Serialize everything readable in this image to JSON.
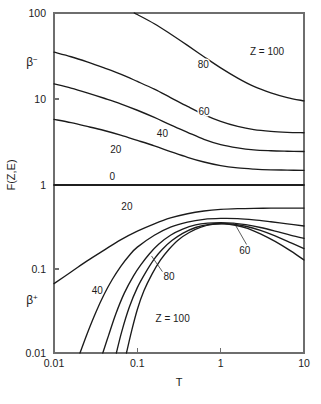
{
  "chart_data": {
    "type": "line",
    "title": "",
    "xlabel": "T",
    "ylabel": "F(Z,E)",
    "xscale": "log",
    "yscale": "log",
    "xlim": [
      0.01,
      10
    ],
    "ylim": [
      0.01,
      100
    ],
    "grid": false,
    "legend": "inline-curve-labels",
    "xticks": [
      "0.01",
      "0.1",
      "1",
      "10"
    ],
    "xtick_values": [
      0.01,
      0.1,
      1,
      10
    ],
    "yticks": [
      "100",
      "10",
      "1",
      "0.1",
      "0.01"
    ],
    "ytick_values": [
      100,
      10,
      1,
      0.1,
      0.01
    ],
    "panels": [
      {
        "name": "beta-minus",
        "label": "β",
        "label_superscript": "−",
        "ylim": [
          1,
          100
        ],
        "series": [
          {
            "name": "Z = 100",
            "label": "Z = 100",
            "label_x": 3.6,
            "label_y": 36.0,
            "x": [
              0.01,
              0.016,
              0.025,
              0.04,
              0.063,
              0.1,
              0.16,
              0.25,
              0.4,
              0.63,
              1.0,
              1.6,
              2.5,
              4.0,
              6.3,
              10.0
            ],
            "y": [
              260.0,
              218.0,
              180.0,
              148.0,
              120.0,
              96.0,
              75.0,
              57.0,
              42.0,
              31.0,
              23.0,
              17.5,
              14.0,
              11.8,
              10.4,
              9.5
            ]
          },
          {
            "name": "80",
            "label": "80",
            "label_x": 0.62,
            "label_y": 25.0,
            "x": [
              0.01,
              0.016,
              0.025,
              0.04,
              0.063,
              0.1,
              0.16,
              0.25,
              0.4,
              0.63,
              1.0,
              1.6,
              2.5,
              4.0,
              6.3,
              10.0
            ],
            "y": [
              35.0,
              31.0,
              27.0,
              23.0,
              19.5,
              16.0,
              13.0,
              10.4,
              8.2,
              6.6,
              5.5,
              4.8,
              4.4,
              4.2,
              4.1,
              4.05
            ]
          },
          {
            "name": "60",
            "label": "60",
            "label_x": 0.63,
            "label_y": 7.2,
            "x": [
              0.01,
              0.016,
              0.025,
              0.04,
              0.063,
              0.1,
              0.16,
              0.25,
              0.4,
              0.63,
              1.0,
              1.6,
              2.5,
              4.0,
              6.3,
              10.0
            ],
            "y": [
              15.0,
              13.4,
              11.8,
              10.2,
              8.8,
              7.4,
              6.1,
              5.0,
              4.1,
              3.4,
              2.95,
              2.7,
              2.56,
              2.5,
              2.47,
              2.45
            ]
          },
          {
            "name": "40",
            "label": "40",
            "label_x": 0.2,
            "label_y": 4.0,
            "x": [
              0.01,
              0.016,
              0.025,
              0.04,
              0.063,
              0.1,
              0.16,
              0.25,
              0.4,
              0.63,
              1.0,
              1.6,
              2.5,
              4.0,
              6.3,
              10.0
            ],
            "y": [
              5.8,
              5.3,
              4.8,
              4.3,
              3.8,
              3.3,
              2.85,
              2.45,
              2.1,
              1.85,
              1.68,
              1.58,
              1.53,
              1.5,
              1.49,
              1.48
            ]
          },
          {
            "name": "20",
            "label": "20",
            "label_x": 0.055,
            "label_y": 2.6,
            "x": [
              0.01,
              0.1,
              1.0,
              10.0
            ],
            "y": [
              1.001,
              1.001,
              1.001,
              1.001
            ]
          },
          {
            "name": "0",
            "label": "0",
            "label_x": 0.05,
            "label_y": 1.25,
            "x": [
              0.01,
              10.0
            ],
            "y": [
              1.0,
              1.0
            ]
          }
        ]
      },
      {
        "name": "beta-plus",
        "label": "β",
        "label_superscript": "+",
        "ylim": [
          0.01,
          1
        ],
        "series": [
          {
            "name": "20",
            "label": "20",
            "label_x": 0.075,
            "label_y": 0.55,
            "x": [
              0.01,
              0.016,
              0.025,
              0.04,
              0.063,
              0.1,
              0.16,
              0.25,
              0.4,
              0.63,
              1.0,
              1.6,
              2.5,
              4.0,
              6.3,
              10.0
            ],
            "y": [
              0.067,
              0.092,
              0.125,
              0.168,
              0.222,
              0.282,
              0.345,
              0.405,
              0.455,
              0.49,
              0.512,
              0.523,
              0.528,
              0.53,
              0.531,
              0.531
            ]
          },
          {
            "name": "40",
            "label": "40",
            "label_x": 0.033,
            "label_y": 0.055,
            "x": [
              0.0205,
              0.025,
              0.032,
              0.04,
              0.05,
              0.063,
              0.08,
              0.1,
              0.16,
              0.25,
              0.4,
              0.63,
              1.0,
              1.6,
              2.5,
              4.0,
              6.3,
              10.0
            ],
            "y": [
              0.01,
              0.017,
              0.031,
              0.05,
              0.075,
              0.107,
              0.145,
              0.182,
              0.252,
              0.315,
              0.362,
              0.39,
              0.4,
              0.398,
              0.385,
              0.365,
              0.345,
              0.325
            ]
          },
          {
            "name": "60",
            "label": "60",
            "label_x": 1.95,
            "label_y": 0.165,
            "leader": {
              "x1": 2.05,
              "y1": 0.195,
              "x2": 1.45,
              "y2": 0.355
            },
            "x": [
              0.0385,
              0.045,
              0.055,
              0.07,
              0.09,
              0.11,
              0.14,
              0.18,
              0.25,
              0.35,
              0.5,
              0.7,
              1.0,
              1.4,
              2.0,
              3.0,
              4.5,
              7.0,
              10.0
            ],
            "y": [
              0.01,
              0.016,
              0.029,
              0.052,
              0.083,
              0.112,
              0.152,
              0.197,
              0.252,
              0.298,
              0.335,
              0.352,
              0.357,
              0.352,
              0.337,
              0.312,
              0.283,
              0.252,
              0.232
            ]
          },
          {
            "name": "80",
            "label": "80",
            "label_x": 0.24,
            "label_y": 0.082,
            "leader": {
              "x1": 0.2,
              "y1": 0.093,
              "x2": 0.148,
              "y2": 0.143
            },
            "x": [
              0.056,
              0.065,
              0.08,
              0.1,
              0.125,
              0.16,
              0.2,
              0.26,
              0.35,
              0.5,
              0.7,
              1.0,
              1.4,
              2.0,
              3.0,
              4.5,
              7.0,
              10.0
            ],
            "y": [
              0.01,
              0.018,
              0.035,
              0.06,
              0.09,
              0.132,
              0.172,
              0.218,
              0.266,
              0.312,
              0.338,
              0.348,
              0.342,
              0.323,
              0.288,
              0.248,
              0.205,
              0.175
            ]
          },
          {
            "name": "Z = 100",
            "label": "Z = 100",
            "label_x": 0.265,
            "label_y": 0.0255,
            "x": [
              0.074,
              0.085,
              0.1,
              0.12,
              0.15,
              0.19,
              0.24,
              0.31,
              0.42,
              0.58,
              0.8,
              1.1,
              1.5,
              2.1,
              3.0,
              4.5,
              7.0,
              10.0
            ],
            "y": [
              0.01,
              0.018,
              0.033,
              0.055,
              0.087,
              0.128,
              0.172,
              0.222,
              0.272,
              0.315,
              0.34,
              0.345,
              0.332,
              0.305,
              0.262,
              0.213,
              0.163,
              0.128
            ]
          }
        ]
      }
    ]
  }
}
